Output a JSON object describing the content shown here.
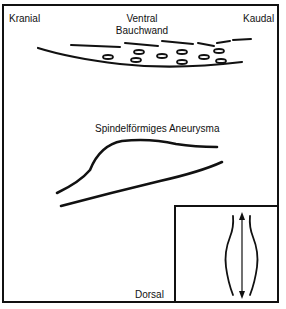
{
  "diagram": {
    "labels": {
      "top_left": "Kranial",
      "top_center_line1": "Ventral",
      "top_center_line2": "Bauchwand",
      "top_right": "Kaudal",
      "middle": "Spindelförmiges Aneurysma",
      "bottom": "Dorsal"
    },
    "icons": {
      "abdominal-wall": "curved lines with ovals (schematic abdominal wall layers)",
      "aneurysm-vessel": "two lines forming a spindle-shaped widening",
      "inset-arrow": "double-headed vertical arrow between two curved walls"
    },
    "colors": {
      "ink": "#111111",
      "background": "#ffffff"
    }
  }
}
